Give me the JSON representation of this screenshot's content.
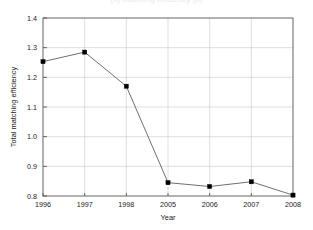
{
  "figure": {
    "caption_remnant": "(a)  Matching efficiency  (b)"
  },
  "chart_data": {
    "type": "line",
    "title": "",
    "xlabel": "Year",
    "ylabel": "Total matching efficiency",
    "categories": [
      "1996",
      "1997",
      "1998",
      "2005",
      "2006",
      "2007",
      "2008"
    ],
    "values": [
      1.253,
      1.285,
      1.17,
      0.845,
      0.832,
      0.848,
      0.803
    ],
    "series": [
      {
        "name": "Total matching efficiency",
        "values": [
          1.253,
          1.285,
          1.17,
          0.845,
          0.832,
          0.848,
          0.803
        ]
      }
    ],
    "ylim": [
      0.8,
      1.4
    ],
    "yticks": [
      "0.8",
      "0.9",
      "1.0",
      "1.1",
      "1.2",
      "1.3",
      "1.4"
    ],
    "ytick_values": [
      0.8,
      0.9,
      1.0,
      1.1,
      1.2,
      1.3,
      1.4
    ],
    "xticks": [
      "1996",
      "1997",
      "1998",
      "2005",
      "2006",
      "2007",
      "2008"
    ],
    "grid": true,
    "legend": "none",
    "marker": "square",
    "line_color": "#4a4a4a",
    "marker_color": "#000000",
    "grid_color": "#c9c9c9",
    "frame_color": "#555555",
    "background": "#ffffff"
  }
}
